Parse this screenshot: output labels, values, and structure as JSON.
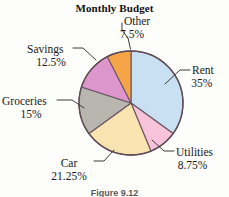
{
  "figure": {
    "title": "Monthly Budget",
    "caption": "Figure 9.12"
  },
  "labels": {
    "other": {
      "name": "Other",
      "percent": "7.5%"
    },
    "rent": {
      "name": "Rent",
      "percent": "35%"
    },
    "utilities": {
      "name": "Utilities",
      "percent": "8.75%"
    },
    "car": {
      "name": "Car",
      "percent": "21.25%"
    },
    "groceries": {
      "name": "Groceries",
      "percent": "15%"
    },
    "savings": {
      "name": "Savings",
      "percent": "12.5%"
    }
  },
  "chart_data": {
    "type": "pie",
    "title": "Monthly Budget",
    "xlabel": "",
    "ylabel": "",
    "legend_position": "callout-labels",
    "grid": false,
    "start_angle_deg": 0,
    "direction": "clockwise",
    "categories": [
      "Rent",
      "Utilities",
      "Car",
      "Groceries",
      "Savings",
      "Other"
    ],
    "values": [
      35,
      8.75,
      21.25,
      15,
      12.5,
      7.5
    ],
    "value_labels": [
      "35%",
      "8.75%",
      "21.25%",
      "15%",
      "12.5%",
      "7.5%"
    ],
    "units": "percent",
    "total": 100,
    "colors": [
      "#c9dff2",
      "#f6c3da",
      "#f9e3b0",
      "#b9b6af",
      "#dd96cc",
      "#f5a545"
    ],
    "slice_angles_deg": [
      126,
      31.5,
      76.5,
      54,
      45,
      27
    ],
    "slices": [
      {
        "label": "Rent",
        "value": 35,
        "value_label": "35%",
        "color": "#c9dff2"
      },
      {
        "label": "Utilities",
        "value": 8.75,
        "value_label": "8.75%",
        "color": "#f6c3da"
      },
      {
        "label": "Car",
        "value": 21.25,
        "value_label": "21.25%",
        "color": "#f9e3b0"
      },
      {
        "label": "Groceries",
        "value": 15,
        "value_label": "15%",
        "color": "#b9b6af"
      },
      {
        "label": "Savings",
        "value": 12.5,
        "value_label": "12.5%",
        "color": "#dd96cc"
      },
      {
        "label": "Other",
        "value": 7.5,
        "value_label": "7.5%",
        "color": "#f5a545"
      }
    ]
  },
  "style": {
    "background": "#fdfdfb",
    "outline": "#6b5663",
    "text": "#1a1a1a"
  }
}
